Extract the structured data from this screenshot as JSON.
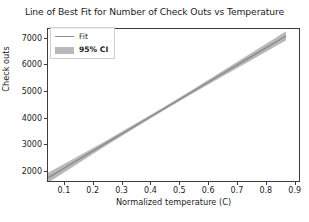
{
  "chart_data": {
    "type": "line",
    "title": "Line of Best Fit for Number of Check Outs vs Temperature",
    "xlabel": "Normalized temperature (C)",
    "ylabel": "Check outs",
    "xlim": [
      0.045,
      0.915
    ],
    "ylim": [
      1620,
      7320
    ],
    "xticks": [
      0.1,
      0.2,
      0.3,
      0.4,
      0.5,
      0.6,
      0.7,
      0.8,
      0.9
    ],
    "xtick_labels": [
      "0.1",
      "0.2",
      "0.3",
      "0.4",
      "0.5",
      "0.6",
      "0.7",
      "0.8",
      "0.9"
    ],
    "yticks": [
      2000,
      3000,
      4000,
      5000,
      6000,
      7000
    ],
    "ytick_labels": [
      "2000",
      "3000",
      "4000",
      "5000",
      "6000",
      "7000"
    ],
    "grid": false,
    "legend_position": "upper left",
    "fit": {
      "intercept": 1450,
      "slope": 6450,
      "x": [
        0.045,
        0.14,
        0.24,
        0.34,
        0.44,
        0.54,
        0.64,
        0.74,
        0.84,
        0.87
      ],
      "y": [
        1740,
        2353,
        2998,
        3643,
        4288,
        4933,
        5578,
        6223,
        6868,
        7062
      ]
    },
    "ci95": {
      "x": [
        0.045,
        0.14,
        0.24,
        0.34,
        0.44,
        0.54,
        0.64,
        0.74,
        0.84,
        0.87
      ],
      "lower": [
        1555,
        2215,
        2900,
        3570,
        4225,
        4860,
        5480,
        6095,
        6710,
        6890
      ],
      "upper": [
        1925,
        2491,
        3096,
        3716,
        4351,
        5006,
        5676,
        6351,
        7026,
        7234
      ]
    },
    "series": [
      {
        "name": "Fit",
        "type": "line",
        "color": "#8d8d8d"
      },
      {
        "name": "95% CI",
        "type": "band",
        "color": "#b9b9b9"
      }
    ]
  },
  "legend": {
    "items": [
      {
        "label": "Fit",
        "key": "line-key"
      },
      {
        "label": "95% CI",
        "key": "patch-key"
      }
    ]
  },
  "colors": {
    "fit_line": "#8d8d8d",
    "ci_band": "#b9b9b9",
    "axis": "#3c3c3c",
    "text": "#1c1c1c",
    "background": "#ffffff"
  }
}
